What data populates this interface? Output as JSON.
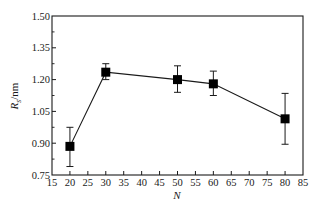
{
  "chart_data": {
    "type": "line",
    "title": "",
    "xlabel": "N",
    "ylabel": "R_s/nm",
    "ylabel_main": "R",
    "ylabel_sub": "s",
    "ylabel_unit": "/nm",
    "xlim": [
      15,
      85
    ],
    "ylim": [
      0.75,
      1.5
    ],
    "xticks": [
      15,
      20,
      25,
      30,
      35,
      40,
      45,
      50,
      55,
      60,
      65,
      70,
      75,
      80,
      85
    ],
    "xtick_labels": [
      "15",
      "20",
      "25",
      "30",
      "35",
      "40",
      "45",
      "50",
      "55",
      "60",
      "65",
      "70",
      "75",
      "80",
      "85"
    ],
    "yticks": [
      0.75,
      0.9,
      1.05,
      1.2,
      1.35,
      1.5
    ],
    "ytick_labels": [
      "0.75",
      "0.90",
      "1.05",
      "1.20",
      "1.35",
      "1.50"
    ],
    "y_minor_ticks": [
      0.825,
      0.975,
      1.125,
      1.275,
      1.425
    ],
    "grid": false,
    "legend": null,
    "marker": "filled-square",
    "series": [
      {
        "name": "R_s",
        "x": [
          20,
          30,
          50,
          60,
          80
        ],
        "y": [
          0.885,
          1.235,
          1.2,
          1.18,
          1.015
        ],
        "error_upper": [
          0.975,
          1.275,
          1.265,
          1.24,
          1.135
        ],
        "error_lower": [
          0.79,
          1.2,
          1.14,
          1.125,
          0.895
        ]
      }
    ]
  },
  "colors": {
    "axis": "#1a1a1a",
    "line": "#1a1a1a",
    "marker": "#000000",
    "background": "#ffffff"
  }
}
